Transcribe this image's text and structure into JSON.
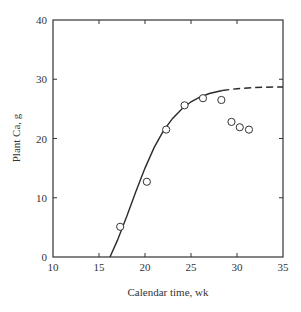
{
  "chart_data": {
    "type": "scatter",
    "title": "",
    "xlabel": "Calendar time, wk",
    "ylabel": "Plant Ca, g",
    "xlim": [
      10,
      35
    ],
    "ylim": [
      0,
      40
    ],
    "xticks": [
      10,
      15,
      20,
      25,
      30,
      35
    ],
    "yticks": [
      0,
      10,
      20,
      30,
      40
    ],
    "grid": false,
    "legend": null,
    "series": [
      {
        "name": "Observed",
        "kind": "scatter",
        "marker": "open-circle",
        "x": [
          17.3,
          20.2,
          22.3,
          24.3,
          26.3,
          28.3,
          29.4,
          30.3,
          31.3
        ],
        "y": [
          5.1,
          12.7,
          21.5,
          25.6,
          26.8,
          26.5,
          22.8,
          21.9,
          21.5
        ]
      },
      {
        "name": "Model fit",
        "kind": "line",
        "style": "solid",
        "x": [
          16.2,
          17.0,
          18.0,
          19.0,
          20.0,
          21.0,
          22.0,
          23.0,
          24.0,
          25.0,
          26.0,
          27.0,
          28.4
        ],
        "y": [
          0.0,
          2.8,
          6.8,
          11.0,
          15.0,
          18.5,
          21.3,
          23.4,
          25.0,
          26.2,
          27.0,
          27.6,
          28.1
        ]
      },
      {
        "name": "Model extrapolation",
        "kind": "line",
        "style": "dashed",
        "x": [
          28.4,
          30.0,
          32.0,
          34.0,
          35.0
        ],
        "y": [
          28.1,
          28.4,
          28.6,
          28.7,
          28.7
        ]
      }
    ]
  },
  "labels": {
    "xlabel": "Calendar time, wk",
    "ylabel": "Plant Ca, g",
    "xticks": [
      "10",
      "15",
      "20",
      "25",
      "30",
      "35"
    ],
    "yticks": [
      "0",
      "10",
      "20",
      "30",
      "40"
    ]
  }
}
